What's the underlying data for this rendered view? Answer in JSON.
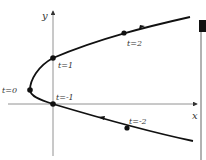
{
  "diagram": {
    "type": "parametric-curve",
    "axes": {
      "x_label": "x",
      "y_label": "y"
    },
    "points": [
      {
        "label": "t=0",
        "x": 30,
        "y": 90
      },
      {
        "label": "t=1",
        "x": 53,
        "y": 58
      },
      {
        "label": "t=-1",
        "x": 53,
        "y": 104
      },
      {
        "label": "t=2",
        "x": 124,
        "y": 33
      },
      {
        "label": "t=-2",
        "x": 127,
        "y": 128
      }
    ],
    "colors": {
      "curve": "#111111",
      "axis": "#555555",
      "label": "#333333"
    }
  }
}
